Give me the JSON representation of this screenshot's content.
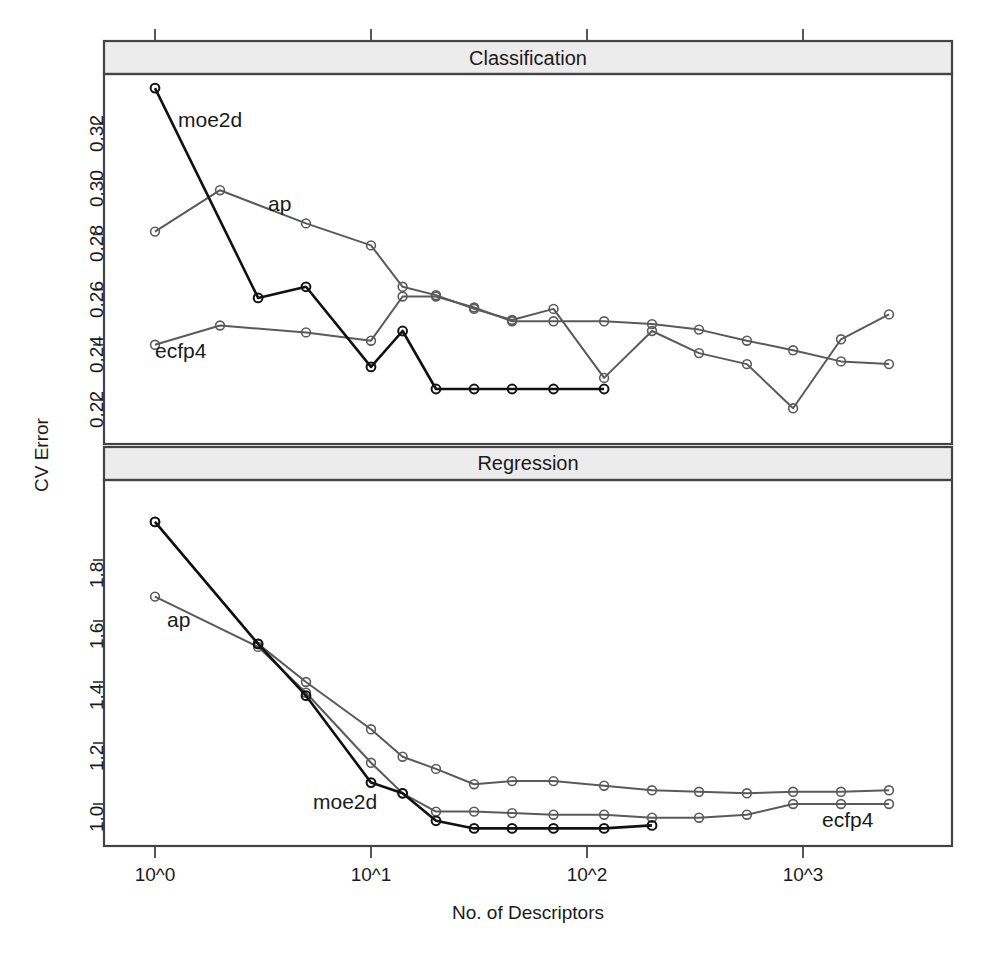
{
  "figure": {
    "y_axis_title": "CV Error",
    "x_axis_title": "No. of Descriptors",
    "panels": [
      {
        "id": "classification",
        "strip_title": "Classification"
      },
      {
        "id": "regression",
        "strip_title": "Regression"
      }
    ]
  },
  "colors": {
    "moe2d": "#111111",
    "ap": "#5a5a5a",
    "ecfp4": "#5a5a5a",
    "frame": "#444444",
    "strip_fill": "#ececec",
    "background": "#ffffff"
  },
  "series_labels": {
    "moe2d": "moe2d",
    "ap": "ap",
    "ecfp4": "ecfp4"
  },
  "axis": {
    "x_ticks": [
      "10^0",
      "10^1",
      "10^2",
      "10^3"
    ],
    "x_tick_values": [
      0,
      1,
      2,
      3
    ],
    "y_ticks_classification": [
      "0.22",
      "0.24",
      "0.26",
      "0.28",
      "0.30",
      "0.32"
    ],
    "y_tick_values_classification": [
      0.22,
      0.24,
      0.26,
      0.28,
      0.3,
      0.32
    ],
    "y_ticks_regression": [
      "1.0",
      "1.2",
      "1.4",
      "1.6",
      "1.8"
    ],
    "y_tick_values_regression": [
      1.0,
      1.2,
      1.4,
      1.6,
      1.8
    ]
  },
  "chart_data": [
    {
      "type": "line",
      "title": "Classification",
      "xlabel": "No. of Descriptors",
      "ylabel": "CV Error",
      "xscale": "log10",
      "xlim": [
        0.88,
        4.0
      ],
      "ylim": [
        0.209,
        0.337
      ],
      "grid": false,
      "legend": "inline-labels",
      "markers": "open-circle",
      "series": [
        {
          "name": "moe2d",
          "color": "#111111",
          "x": [
            1,
            3,
            5,
            10,
            14,
            20,
            30,
            45,
            70,
            120
          ],
          "y": [
            0.333,
            0.257,
            0.261,
            0.232,
            0.245,
            0.224,
            0.224,
            0.224,
            0.224,
            0.224
          ]
        },
        {
          "name": "ap",
          "color": "#5a5a5a",
          "x": [
            1,
            2,
            5,
            10,
            14,
            20,
            30,
            45,
            70,
            120,
            200,
            330,
            550,
            900,
            1500,
            2500
          ],
          "y": [
            0.281,
            0.296,
            0.284,
            0.276,
            0.261,
            0.258,
            0.253,
            0.249,
            0.253,
            0.228,
            0.245,
            0.237,
            0.233,
            0.217,
            0.242,
            0.251
          ]
        },
        {
          "name": "ecfp4",
          "color": "#5a5a5a",
          "x": [
            1,
            2,
            5,
            10,
            14,
            20,
            30,
            45,
            70,
            120,
            200,
            330,
            550,
            900,
            1500,
            2500
          ],
          "y": [
            0.24,
            0.247,
            0.2445,
            0.2415,
            0.2575,
            0.2575,
            0.2535,
            0.2485,
            0.2485,
            0.2485,
            0.2475,
            0.2455,
            0.2415,
            0.238,
            0.234,
            0.233
          ]
        }
      ]
    },
    {
      "type": "line",
      "title": "Regression",
      "xlabel": "No. of Descriptors",
      "ylabel": "CV Error",
      "xscale": "log10",
      "xlim": [
        0.88,
        4.0
      ],
      "ylim": [
        0.9,
        1.97
      ],
      "grid": false,
      "legend": "inline-labels",
      "markers": "open-circle",
      "series": [
        {
          "name": "moe2d",
          "color": "#111111",
          "x": [
            1,
            3,
            5,
            10,
            14,
            20,
            30,
            45,
            70,
            120,
            200
          ],
          "y": [
            1.925,
            1.525,
            1.355,
            1.07,
            1.035,
            0.945,
            0.92,
            0.92,
            0.92,
            0.92,
            0.93
          ]
        },
        {
          "name": "ap",
          "color": "#5a5a5a",
          "x": [
            1,
            3,
            5,
            10,
            14,
            20,
            30,
            45,
            70,
            120,
            200,
            330,
            550,
            900,
            1500,
            2500
          ],
          "y": [
            1.68,
            1.515,
            1.365,
            1.135,
            1.035,
            0.975,
            0.975,
            0.97,
            0.965,
            0.965,
            0.955,
            0.955,
            0.965,
            1.0,
            1.0,
            1.0
          ]
        },
        {
          "name": "ecfp4",
          "color": "#5a5a5a",
          "x": [
            1,
            3,
            5,
            10,
            14,
            20,
            30,
            45,
            70,
            120,
            200,
            330,
            550,
            900,
            1500,
            2500
          ],
          "y": [
            1.925,
            1.525,
            1.4,
            1.245,
            1.155,
            1.115,
            1.065,
            1.075,
            1.075,
            1.06,
            1.045,
            1.04,
            1.035,
            1.04,
            1.04,
            1.045
          ]
        }
      ]
    }
  ]
}
